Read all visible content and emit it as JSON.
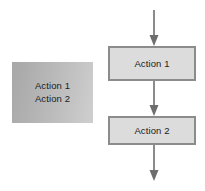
{
  "diagram": {
    "background_color": "#ffffff",
    "legend_block": {
      "name": "grouped-actions",
      "fill_color": "#b4b4b4",
      "lines": [
        {
          "label": "Action 1"
        },
        {
          "label": "Action 2"
        }
      ]
    },
    "flow": {
      "box_fill_color": "#dcdcdc",
      "box_border_color": "#8c8c8c",
      "connector_color": "#6e6e6e",
      "nodes": [
        {
          "id": "action-1",
          "label": "Action 1",
          "shape": "process"
        },
        {
          "id": "action-2",
          "label": "Action 2",
          "shape": "process"
        }
      ],
      "connectors": [
        {
          "id": "entry-arrow",
          "from": "start",
          "to": "action-1",
          "direction": "down"
        },
        {
          "id": "mid-arrow",
          "from": "action-1",
          "to": "action-2",
          "direction": "down"
        },
        {
          "id": "exit-arrow",
          "from": "action-2",
          "to": "end",
          "direction": "down"
        }
      ]
    }
  }
}
